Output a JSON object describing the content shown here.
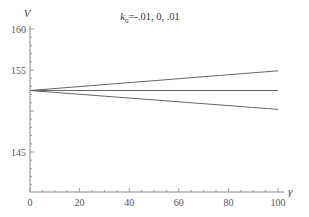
{
  "chart_data": {
    "type": "line",
    "title_prefix": "k",
    "title_subscript": "0",
    "title_suffix": "=-.01, 0, .01",
    "xlabel": "γ",
    "ylabel": "V",
    "xlim": [
      0,
      100
    ],
    "ylim": [
      140,
      160
    ],
    "xticks": [
      0,
      20,
      40,
      60,
      80,
      100
    ],
    "yticks": [
      145,
      150,
      155,
      160
    ],
    "ytick_labels": [
      "145",
      "",
      "155",
      "160"
    ],
    "grid": false,
    "series": [
      {
        "name": "k0=.01",
        "x": [
          0,
          100
        ],
        "values": [
          152.5,
          154.9
        ]
      },
      {
        "name": "k0=0",
        "x": [
          0,
          100
        ],
        "values": [
          152.5,
          152.5
        ]
      },
      {
        "name": "k0=-.01",
        "x": [
          0,
          100
        ],
        "values": [
          152.5,
          150.2
        ]
      }
    ]
  }
}
